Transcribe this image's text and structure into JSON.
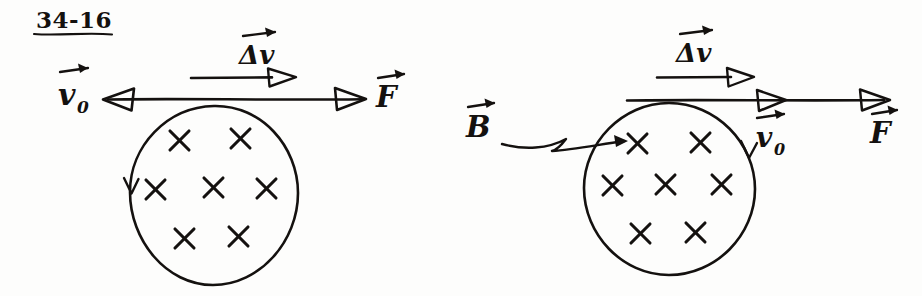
{
  "page": {
    "title": "34-16",
    "background_color": "#fdfdfc",
    "ink_color": "#14110f",
    "width": 922,
    "height": 296
  },
  "figures": [
    {
      "id": "left-figure",
      "name": "left-diagram",
      "description": "Circle of into-page field crosses with velocity, delta-v and force vectors",
      "circle": {
        "cx": 213,
        "cy": 196,
        "rx": 85,
        "ry": 90
      },
      "field_symbol": "×",
      "field_count": 7,
      "field_marks": [
        {
          "x": 179,
          "y": 140
        },
        {
          "x": 240,
          "y": 138
        },
        {
          "x": 155,
          "y": 189
        },
        {
          "x": 213,
          "y": 187
        },
        {
          "x": 266,
          "y": 188
        },
        {
          "x": 184,
          "y": 238
        },
        {
          "x": 238,
          "y": 236
        }
      ],
      "circulation_arrow": {
        "side": "left",
        "direction": "down"
      },
      "labels": [
        {
          "name": "v0-label",
          "text": "v",
          "subscript": "0",
          "vector": true,
          "x": 62,
          "y": 105
        },
        {
          "name": "delta-v-label",
          "text": "Δv",
          "vector": true,
          "x": 244,
          "y": 62
        },
        {
          "name": "force-label",
          "text": "F",
          "vector": true,
          "x": 381,
          "y": 106
        }
      ],
      "vectors": [
        {
          "name": "v0-vector",
          "direction": "left",
          "x1": 365,
          "y1": 99,
          "x2": 103,
          "y2": 99
        },
        {
          "name": "delta-v-vector",
          "direction": "right",
          "x1": 190,
          "y1": 78,
          "x2": 298,
          "y2": 78
        },
        {
          "name": "force-vector",
          "direction": "right",
          "x1": 103,
          "y1": 99,
          "x2": 365,
          "y2": 99
        }
      ]
    },
    {
      "id": "right-figure",
      "name": "right-diagram",
      "description": "Circle of into-page field crosses labelled B with velocity, delta-v and force vectors",
      "circle": {
        "cx": 669,
        "cy": 189,
        "rx": 86,
        "ry": 86
      },
      "field_symbol": "×",
      "field_count": 7,
      "field_marks": [
        {
          "x": 637,
          "y": 143
        },
        {
          "x": 700,
          "y": 142
        },
        {
          "x": 612,
          "y": 185
        },
        {
          "x": 665,
          "y": 184
        },
        {
          "x": 721,
          "y": 184
        },
        {
          "x": 640,
          "y": 233
        },
        {
          "x": 695,
          "y": 232
        }
      ],
      "circulation_arrow": {
        "side": "right",
        "direction": "down"
      },
      "pointer": {
        "name": "b-pointer",
        "from_x": 505,
        "from_y": 143,
        "to_x": 625,
        "to_y": 142
      },
      "labels": [
        {
          "name": "b-label",
          "text": "B",
          "vector": true,
          "x": 469,
          "y": 136
        },
        {
          "name": "delta-v-label",
          "text": "Δv",
          "vector": true,
          "x": 681,
          "y": 60
        },
        {
          "name": "v0-label",
          "text": "v",
          "subscript": "0",
          "vector": true,
          "x": 762,
          "y": 146
        },
        {
          "name": "force-label",
          "text": "F",
          "vector": true,
          "x": 876,
          "y": 142
        }
      ],
      "vectors": [
        {
          "name": "delta-v-vector",
          "direction": "right",
          "x1": 656,
          "y1": 78,
          "x2": 752,
          "y2": 78
        },
        {
          "name": "velocity-force-line",
          "direction": "right",
          "x1": 625,
          "y1": 100,
          "x2": 885,
          "y2": 100
        },
        {
          "name": "v0-arrowhead",
          "direction": "right",
          "x": 770,
          "y": 100
        },
        {
          "name": "force-arrowhead",
          "direction": "right",
          "x": 882,
          "y": 100
        }
      ]
    }
  ],
  "notation": {
    "cross_meaning": "field into page",
    "vector_accent": "arrow over symbol"
  }
}
